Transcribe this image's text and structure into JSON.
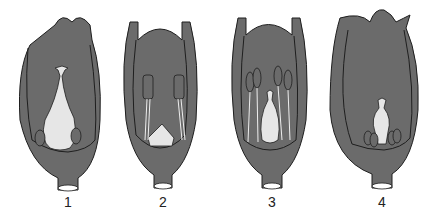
{
  "diagram": {
    "type": "flower-longitudinal-sections",
    "colors": {
      "perianth": "#6b6b6b",
      "outline": "#1e1e1e",
      "pistil": "#e6e6e6",
      "background": "#ffffff"
    },
    "panels": [
      {
        "label": "1",
        "description": "Flower bud with central pistil and small stamens at base"
      },
      {
        "label": "2",
        "description": "Open flower with two long stamens and small ovary"
      },
      {
        "label": "3",
        "description": "Flower with four stamens surrounding a flask-shaped pistil"
      },
      {
        "label": "4",
        "description": "Closed flower with small pistil and stamens at base"
      }
    ]
  }
}
